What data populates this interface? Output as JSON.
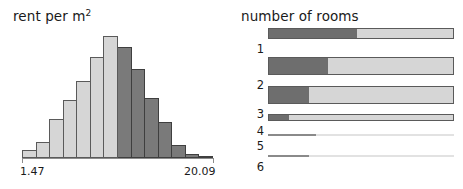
{
  "histogram_panel": {
    "title": "rent per m",
    "title_superscript": "2",
    "axis": {
      "min_label": "1.47",
      "max_label": "20.09"
    }
  },
  "spine_panel": {
    "title": "number of rooms",
    "row_labels": [
      "1",
      "2",
      "3",
      "4",
      "5",
      "6"
    ]
  },
  "colors": {
    "light": "#d6d6d6",
    "dark": "#7a7a7a",
    "outline": "#5a5a5a",
    "axis": "#8c8c8c",
    "text": "#1a1a1a"
  },
  "chart_data": [
    {
      "type": "bar",
      "name": "rent-per-m2-histogram",
      "title": "rent per m2",
      "xlabel": "",
      "ylabel": "",
      "xlim": [
        1.47,
        20.09
      ],
      "grid": false,
      "legend": false,
      "orientation": "vertical",
      "bin_width": 1.33,
      "categories": [
        "1.47-2.80",
        "2.80-4.13",
        "4.13-5.46",
        "5.46-6.79",
        "6.79-8.12",
        "8.12-9.45",
        "9.45-10.78",
        "10.78-12.11",
        "12.11-13.44",
        "13.44-14.77",
        "14.77-16.10",
        "16.10-17.43",
        "17.43-18.76",
        "18.76-20.09"
      ],
      "values": [
        6,
        13,
        31,
        46,
        61,
        80,
        97,
        88,
        71,
        48,
        29,
        10,
        3,
        1
      ],
      "bar_highlight": [
        "light",
        "light",
        "light",
        "light",
        "light",
        "light",
        "light",
        "dark",
        "dark",
        "dark",
        "dark",
        "dark",
        "dark",
        "dark"
      ],
      "tick_labels": [
        "1.47",
        "20.09"
      ]
    },
    {
      "type": "bar",
      "name": "number-of-rooms-spineplot",
      "title": "number of rooms",
      "xlabel": "",
      "ylabel": "",
      "orientation": "horizontal",
      "stacked": true,
      "grid": false,
      "legend": false,
      "categories": [
        "1",
        "2",
        "3",
        "4",
        "5",
        "6"
      ],
      "bar_thickness_pct": [
        62,
        100,
        100,
        38,
        5,
        4
      ],
      "series": [
        {
          "name": "highlighted",
          "values": [
            48,
            32,
            22,
            11,
            26,
            22
          ]
        },
        {
          "name": "remainder",
          "values": [
            52,
            68,
            78,
            89,
            74,
            78
          ]
        }
      ]
    }
  ]
}
